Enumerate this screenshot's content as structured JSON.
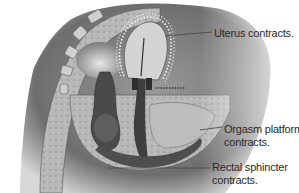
{
  "figure": {
    "labels": [
      {
        "id": "uterus",
        "text": "Uterus contracts."
      },
      {
        "id": "orgasm_platform",
        "line1": "Orgasm platform",
        "line2": "contracts."
      },
      {
        "id": "rectal_sphincter",
        "line1": "Rectal sphincter",
        "line2": "contracts."
      }
    ]
  },
  "colors": {
    "background": "#ffffff",
    "tissue_dark": "#5a5a5a",
    "tissue_mid": "#8c8c8c",
    "tissue_light": "#c8c8c8",
    "outline": "#3a3a3a",
    "contraction_dots": "#f2f2f2",
    "leader_line": "#444444"
  }
}
